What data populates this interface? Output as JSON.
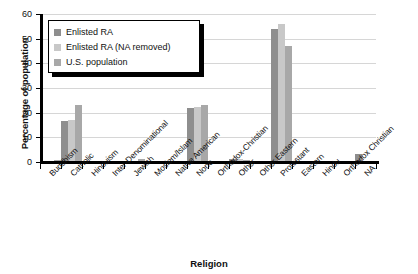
{
  "chart_data": {
    "type": "bar",
    "title": "",
    "xlabel": "Religion",
    "ylabel": "Percentage of population",
    "ylim": [
      0,
      60
    ],
    "yticks": [
      0,
      10,
      20,
      30,
      40,
      50,
      60
    ],
    "grid": true,
    "legend_position": "upper-left",
    "categories": [
      "Buddhism",
      "Catholic",
      "Hinduism",
      "Inter-Denominational",
      "Jewish",
      "Moslem/Islam",
      "Native American",
      "None",
      "Orthodox-Christian",
      "Other",
      "Other Eastern",
      "Protestant",
      "Eastern",
      "Hindu",
      "Orthodox Christian",
      "NA"
    ],
    "series": [
      {
        "name": "Enlisted RA",
        "color": "#8e8e8e",
        "values": [
          0.3,
          16.5,
          0.0,
          0.0,
          0.3,
          0.4,
          0.0,
          21.8,
          0.0,
          1.1,
          0.2,
          54.0,
          0.0,
          0.0,
          0.0,
          3.4
        ]
      },
      {
        "name": "Enlisted RA (NA removed)",
        "color": "#c8c8c8",
        "values": [
          0.35,
          17.0,
          0.0,
          0.0,
          0.3,
          0.45,
          0.0,
          22.5,
          0.0,
          1.2,
          0.2,
          56.0,
          0.0,
          0.0,
          0.0,
          0.0
        ]
      },
      {
        "name": "U.S. population",
        "color": "#a8a8a8",
        "values": [
          0.7,
          23.0,
          0.4,
          0.0,
          1.4,
          0.6,
          0.0,
          23.0,
          0.3,
          1.0,
          0.0,
          47.0,
          0.0,
          0.0,
          0.0,
          0.0
        ]
      }
    ]
  },
  "legend": {
    "items": [
      {
        "label": "Enlisted RA"
      },
      {
        "label": "Enlisted RA (NA removed)"
      },
      {
        "label": "U.S. population"
      }
    ]
  }
}
